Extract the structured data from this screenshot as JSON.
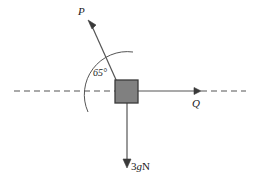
{
  "diagram": {
    "background_color": "#ffffff",
    "stroke_color": "#555555",
    "text_color": "#1a1a1a",
    "block": {
      "fill_color": "#808080",
      "border_color": "#3a3a3a",
      "x": 115,
      "y": 80,
      "width": 23,
      "height": 23
    },
    "horizontal_axis": {
      "style": "dashed",
      "y": 91,
      "x_start": 14,
      "x_end": 246
    },
    "forces": [
      {
        "name": "P",
        "label": "P",
        "direction": "up-left",
        "angle_deg": 65,
        "origin": [
          115,
          80
        ],
        "tip": [
          88,
          20
        ]
      },
      {
        "name": "Q",
        "label": "Q",
        "direction": "right",
        "angle_deg": 0,
        "origin": [
          138,
          91
        ],
        "tip": [
          200,
          91
        ]
      },
      {
        "name": "weight",
        "label_magnitude": "3",
        "label_symbol": "g",
        "label_unit": "N",
        "label": "3gN",
        "direction": "down",
        "origin": [
          127,
          103
        ],
        "tip": [
          127,
          167
        ]
      }
    ],
    "angle_arc": {
      "label": "65°",
      "value": 65,
      "unit": "degrees",
      "vertex": [
        115,
        91
      ],
      "radius": 43
    }
  }
}
